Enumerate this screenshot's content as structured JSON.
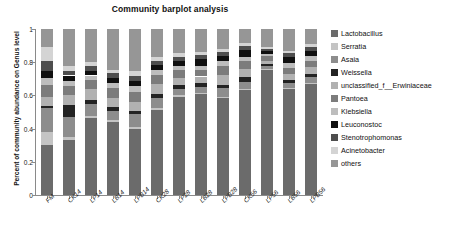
{
  "chart_data": {
    "type": "bar",
    "title": "Community barplot analysis",
    "xlabel": "",
    "ylabel": "Percent of community abundance on Genus level",
    "ylim": [
      0,
      1
    ],
    "yticks": [
      "0",
      "0.2",
      "0.4",
      "0.6",
      "0.8",
      "1"
    ],
    "grid": false,
    "stacked": true,
    "legend_position": "right",
    "categories": [
      "FM",
      "CK14",
      "LP14",
      "LB14",
      "LPB14",
      "CK28",
      "LP28",
      "LB28",
      "LPB28",
      "CK56",
      "LP56",
      "LB56",
      "LPB56"
    ],
    "series": [
      {
        "name": "Lactobacillus",
        "color": "#6b6b6b",
        "values": [
          0.3,
          0.33,
          0.465,
          0.437,
          0.4,
          0.513,
          0.593,
          0.606,
          0.583,
          0.63,
          0.752,
          0.637,
          0.667
        ]
      },
      {
        "name": "Serratia",
        "color": "#c4c4c4",
        "values": [
          0.08,
          0.02,
          0.01,
          0.012,
          0.012,
          0.01,
          0.008,
          0.008,
          0.01,
          0.01,
          0.006,
          0.008,
          0.008
        ]
      },
      {
        "name": "Asaia",
        "color": "#8d8d8d",
        "values": [
          0.145,
          0.12,
          0.075,
          0.06,
          0.075,
          0.06,
          0.04,
          0.035,
          0.05,
          0.04,
          0.02,
          0.03,
          0.035
        ]
      },
      {
        "name": "Weissella",
        "color": "#232323",
        "values": [
          0.01,
          0.07,
          0.02,
          0.02,
          0.02,
          0.025,
          0.02,
          0.025,
          0.022,
          0.03,
          0.01,
          0.018,
          0.02
        ]
      },
      {
        "name": "unclassified_f__Erwiniaceae",
        "color": "#b1b1b1",
        "values": [
          0.055,
          0.06,
          0.07,
          0.055,
          0.055,
          0.06,
          0.045,
          0.04,
          0.06,
          0.05,
          0.022,
          0.035,
          0.04
        ]
      },
      {
        "name": "Pantoea",
        "color": "#7c7c7c",
        "values": [
          0.07,
          0.055,
          0.05,
          0.06,
          0.06,
          0.055,
          0.045,
          0.04,
          0.05,
          0.045,
          0.025,
          0.04,
          0.04
        ]
      },
      {
        "name": "Klebsiella",
        "color": "#bdbdbd",
        "values": [
          0.045,
          0.03,
          0.03,
          0.03,
          0.035,
          0.03,
          0.025,
          0.025,
          0.03,
          0.028,
          0.015,
          0.025,
          0.028
        ]
      },
      {
        "name": "Leuconostoc",
        "color": "#101010",
        "values": [
          0.045,
          0.035,
          0.03,
          0.03,
          0.03,
          0.03,
          0.032,
          0.04,
          0.03,
          0.038,
          0.02,
          0.04,
          0.03
        ]
      },
      {
        "name": "Stenotrophomonas",
        "color": "#4e4e4e",
        "values": [
          0.055,
          0.03,
          0.03,
          0.03,
          0.03,
          0.025,
          0.025,
          0.025,
          0.025,
          0.025,
          0.012,
          0.02,
          0.022
        ]
      },
      {
        "name": "Acinetobacter",
        "color": "#d4d4d4",
        "values": [
          0.085,
          0.03,
          0.02,
          0.02,
          0.03,
          0.022,
          0.02,
          0.018,
          0.02,
          0.02,
          0.01,
          0.015,
          0.018
        ]
      },
      {
        "name": "others",
        "color": "#969696",
        "values": [
          0.11,
          0.22,
          0.2,
          0.246,
          0.253,
          0.17,
          0.147,
          0.138,
          0.12,
          0.084,
          0.108,
          0.132,
          0.092
        ]
      }
    ]
  },
  "axis": {
    "y_ticks": [
      "1",
      "0.8",
      "0.6",
      "0.4",
      "0.2",
      "0"
    ],
    "x_ticks": [
      "FM",
      "CK14",
      "LP14",
      "LB14",
      "LPB14",
      "CK28",
      "LP28",
      "LB28",
      "LPB28",
      "CK56",
      "LP56",
      "LB56",
      "LPB56"
    ]
  },
  "legend": {
    "items": [
      {
        "label": "Lactobacillus",
        "color": "#6b6b6b"
      },
      {
        "label": "Serratia",
        "color": "#c4c4c4"
      },
      {
        "label": "Asaia",
        "color": "#8d8d8d"
      },
      {
        "label": "Weissella",
        "color": "#232323"
      },
      {
        "label": "unclassified_f__Erwiniaceae",
        "color": "#b1b1b1"
      },
      {
        "label": "Pantoea",
        "color": "#7c7c7c"
      },
      {
        "label": "Klebsiella",
        "color": "#bdbdbd"
      },
      {
        "label": "Leuconostoc",
        "color": "#101010"
      },
      {
        "label": "Stenotrophomonas",
        "color": "#4e4e4e"
      },
      {
        "label": "Acinetobacter",
        "color": "#d4d4d4"
      },
      {
        "label": "others",
        "color": "#969696"
      }
    ]
  }
}
